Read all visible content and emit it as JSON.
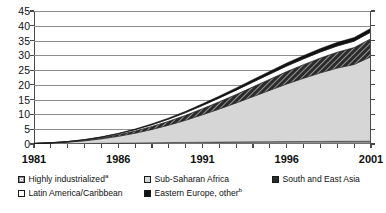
{
  "chart_data": {
    "type": "area",
    "stacked": true,
    "title": "",
    "xlabel": "",
    "ylabel": "",
    "xlim": [
      1981,
      2001
    ],
    "ylim": [
      0,
      45
    ],
    "y_ticks": [
      0,
      5,
      10,
      15,
      20,
      25,
      30,
      35,
      40,
      45
    ],
    "x_ticks": [
      1981,
      1986,
      1991,
      1996,
      2001
    ],
    "x_tick_labels": [
      "1981",
      "1986",
      "1991",
      "1996",
      "2001"
    ],
    "grid": "horizontal",
    "legend_position": "below",
    "x": [
      1981,
      1982,
      1983,
      1984,
      1985,
      1986,
      1987,
      1988,
      1989,
      1990,
      1991,
      1992,
      1993,
      1994,
      1995,
      1996,
      1997,
      1998,
      1999,
      2000,
      2001
    ],
    "series": [
      {
        "name": "Highly industrialized",
        "color": "#8f8f8f",
        "pattern": "solid-gray",
        "values": [
          0.05,
          0.08,
          0.12,
          0.18,
          0.24,
          0.3,
          0.36,
          0.42,
          0.48,
          0.54,
          0.6,
          0.65,
          0.7,
          0.74,
          0.78,
          0.82,
          0.85,
          0.88,
          0.9,
          0.92,
          0.95
        ]
      },
      {
        "name": "Sub-Saharan Africa",
        "color": "#d6d6d6",
        "pattern": "light-gray",
        "values": [
          0.1,
          0.25,
          0.5,
          0.9,
          1.5,
          2.3,
          3.3,
          4.5,
          5.9,
          7.5,
          9.3,
          11.2,
          13.2,
          15.3,
          17.4,
          19.5,
          21.4,
          23.2,
          24.8,
          26.0,
          28.6
        ]
      },
      {
        "name": "South and East Asia",
        "color": "#2b2b2b",
        "pattern": "hatched",
        "values": [
          0.03,
          0.06,
          0.12,
          0.22,
          0.36,
          0.54,
          0.76,
          1.02,
          1.32,
          1.66,
          2.04,
          2.44,
          2.86,
          3.3,
          3.74,
          4.18,
          4.6,
          5.0,
          5.36,
          5.7,
          6.1
        ]
      },
      {
        "name": "Latin America/Caribbean",
        "color": "#ffffff",
        "pattern": "white",
        "values": [
          0.02,
          0.04,
          0.08,
          0.14,
          0.22,
          0.32,
          0.44,
          0.58,
          0.74,
          0.92,
          1.1,
          1.28,
          1.46,
          1.62,
          1.76,
          1.88,
          1.98,
          2.06,
          2.12,
          2.18,
          2.25
        ]
      },
      {
        "name": "Eastern Europe, other",
        "color": "#111111",
        "pattern": "black",
        "values": [
          0.01,
          0.02,
          0.04,
          0.07,
          0.11,
          0.16,
          0.22,
          0.29,
          0.37,
          0.46,
          0.56,
          0.66,
          0.76,
          0.86,
          0.95,
          1.03,
          1.1,
          1.16,
          1.21,
          1.25,
          1.3
        ]
      }
    ],
    "totals": [
      0.21,
      0.45,
      0.86,
      1.51,
      2.43,
      3.62,
      5.08,
      6.81,
      8.81,
      11.08,
      13.6,
      16.23,
      18.98,
      21.82,
      24.63,
      27.41,
      29.93,
      32.3,
      34.39,
      36.05,
      39.2
    ]
  },
  "axes": {
    "y_ticks": [
      "45",
      "40",
      "35",
      "30",
      "25",
      "20",
      "15",
      "10",
      "5",
      "0"
    ],
    "x_ticks": [
      "1981",
      "1986",
      "1991",
      "1996",
      "2001"
    ]
  },
  "legend": {
    "row1": [
      {
        "label": "Highly industrialized",
        "sup": "a",
        "swatch": "gray-square-icon"
      },
      {
        "label": "Sub-Saharan Africa",
        "sup": "",
        "swatch": "light-gray-square-icon"
      },
      {
        "label": "South and East Asia",
        "sup": "",
        "swatch": "dark-hatched-square-icon"
      }
    ],
    "row2": [
      {
        "label": "Latin America/Caribbean",
        "sup": "",
        "swatch": "white-square-icon"
      },
      {
        "label": "Eastern Europe, other",
        "sup": "b",
        "swatch": "black-square-icon"
      }
    ]
  }
}
